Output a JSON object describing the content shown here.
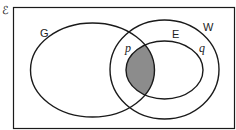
{
  "diagram": {
    "type": "venn",
    "universal_set_symbol": "ℰ",
    "sets": [
      {
        "name": "G",
        "label": "G"
      },
      {
        "name": "W",
        "label": "W"
      },
      {
        "name": "E",
        "label": "E",
        "subset_of": "W"
      }
    ],
    "region_labels": [
      {
        "label": "p",
        "region": "G ∩ W outside E"
      },
      {
        "label": "q",
        "region": "W outside E"
      }
    ],
    "shaded_region": "G ∩ E",
    "colors": {
      "stroke": "#1a1a1a",
      "shade": "#8c8c8c",
      "background": "#ffffff"
    }
  }
}
